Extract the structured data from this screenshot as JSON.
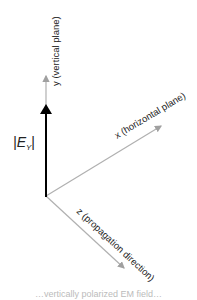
{
  "diagram": {
    "axes": {
      "y": {
        "label": "y (vertical plane)"
      },
      "x": {
        "label": "x (horizontal plane)"
      },
      "z": {
        "label": "z (propagation direction)"
      }
    },
    "field_vector": {
      "label_prefix": "|E",
      "label_sub": "Y",
      "label_suffix": "|"
    },
    "colors": {
      "axis": "#b0b0b0",
      "field_vector": "#000000",
      "text": "#222222"
    }
  },
  "caption": {
    "text": "…vertically polarized EM field…"
  }
}
